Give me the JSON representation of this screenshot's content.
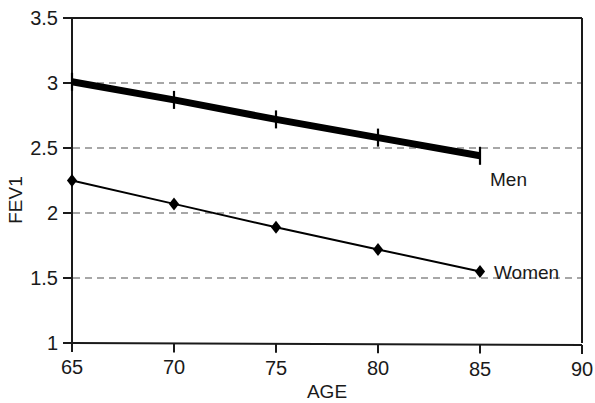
{
  "chart_data": {
    "type": "line",
    "title": "",
    "subtitle": "",
    "xlabel": "AGE",
    "ylabel": "FEV1",
    "x": [
      65,
      70,
      75,
      80,
      85
    ],
    "xlim": [
      65,
      90
    ],
    "ylim": [
      1,
      3.5
    ],
    "xticks": [
      "65",
      "70",
      "75",
      "80",
      "85",
      "90"
    ],
    "xtick_values": [
      65,
      70,
      75,
      80,
      85,
      90
    ],
    "yticks": [
      "1",
      "1.5",
      "2",
      "2.5",
      "3",
      "3.5"
    ],
    "ytick_values": [
      1,
      1.5,
      2,
      2.5,
      3,
      3.5
    ],
    "grid": "horizontal-dashed",
    "gridline_values": [
      1.5,
      2,
      2.5,
      3
    ],
    "legend_position": "inline-right-of-series",
    "series": [
      {
        "name": "Men",
        "values": [
          3.01,
          2.87,
          2.72,
          2.58,
          2.44
        ],
        "marker": "plus",
        "line_width": "thick",
        "color": "#000000",
        "label": "Men"
      },
      {
        "name": "Women",
        "values": [
          2.25,
          2.07,
          1.89,
          1.72,
          1.55
        ],
        "marker": "diamond",
        "line_width": "thin",
        "color": "#000000",
        "label": "Women"
      }
    ]
  },
  "colors": {
    "axis": "#1a1a1a",
    "grid": "#8a8a8a",
    "series": "#000000",
    "background": "#ffffff"
  }
}
